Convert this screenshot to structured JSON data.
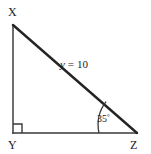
{
  "figure": {
    "background_color": "#ffffff",
    "stroke_color": "#2b2b2b",
    "leg_stroke_color": "#4a4a4a",
    "vertices": {
      "x": {
        "label": "X",
        "cx": 13,
        "cy": 25,
        "label_x": 8,
        "label_y": 16
      },
      "y": {
        "label": "Y",
        "cx": 13,
        "cy": 133,
        "label_x": 8,
        "label_y": 149
      },
      "z": {
        "label": "Z",
        "cx": 137,
        "cy": 133,
        "label_x": 131,
        "label_y": 149
      }
    },
    "sides": {
      "hypotenuse": {
        "name": "XZ",
        "variable": "y",
        "equals": "=",
        "value": "10",
        "full_label": "y = 10",
        "label_x": 75,
        "label_y": 68
      },
      "vertical_leg": {
        "name": "XY"
      },
      "horizontal_leg": {
        "name": "YZ"
      }
    },
    "angles": {
      "at_z": {
        "label": "35",
        "degree_symbol": "°",
        "full_label": "35°",
        "value_degrees": 35,
        "label_x": 97,
        "label_y": 122,
        "arc_radius": 38
      },
      "at_y": {
        "label": "right-angle",
        "value_degrees": 90,
        "marker_size": 8
      }
    }
  }
}
